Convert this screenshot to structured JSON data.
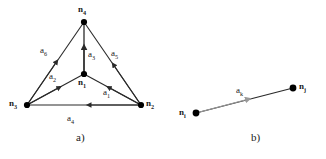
{
  "figure": {
    "colors": {
      "edge": "#2a2a2a",
      "node": "#000000",
      "gray_arrow": "#9a9a9a",
      "background": "#ffffff"
    },
    "panels": [
      {
        "id": "a",
        "caption": "a)",
        "nodes": [
          {
            "id": "n4",
            "label": "n",
            "sub": "4",
            "x": 84,
            "y": 22
          },
          {
            "id": "n1",
            "label": "n",
            "sub": "1",
            "x": 84,
            "y": 74
          },
          {
            "id": "n3",
            "label": "n",
            "sub": "3",
            "x": 27,
            "y": 105
          },
          {
            "id": "n2",
            "label": "n",
            "sub": "2",
            "x": 141,
            "y": 105
          }
        ],
        "arcs": [
          {
            "id": "a1",
            "label": "a",
            "sub": "1",
            "from": "n2",
            "to": "n1"
          },
          {
            "id": "a2",
            "label": "a",
            "sub": "2",
            "from": "n3",
            "to": "n1"
          },
          {
            "id": "a3",
            "label": "a",
            "sub": "3",
            "from": "n1",
            "to": "n4"
          },
          {
            "id": "a4",
            "label": "a",
            "sub": "4",
            "from": "n2",
            "to": "n3"
          },
          {
            "id": "a5",
            "label": "a",
            "sub": "5",
            "from": "n2",
            "to": "n4"
          },
          {
            "id": "a6",
            "label": "a",
            "sub": "6",
            "from": "n3",
            "to": "n4"
          }
        ]
      },
      {
        "id": "b",
        "caption": "b)",
        "nodes": [
          {
            "id": "ni",
            "label": "n",
            "sub": "i",
            "x": 33,
            "y": 113
          },
          {
            "id": "nj",
            "label": "n",
            "sub": "j",
            "x": 130,
            "y": 88
          }
        ],
        "arcs": [
          {
            "id": "ak",
            "label": "a",
            "sub": "k",
            "from": "ni",
            "to": "nj"
          }
        ]
      }
    ]
  }
}
